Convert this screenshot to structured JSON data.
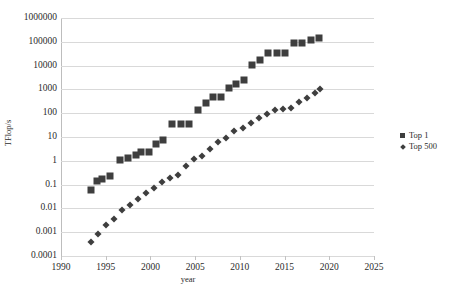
{
  "chart_data": {
    "type": "scatter",
    "title": "",
    "xlabel": "year",
    "ylabel": "TFlop/s",
    "xlim": [
      1990,
      2025
    ],
    "ylim": [
      0.0001,
      1000000
    ],
    "yscale": "log",
    "grid": true,
    "legend_position": "right",
    "xticks": [
      "1990",
      "1995",
      "2000",
      "2005",
      "2010",
      "2015",
      "2020",
      "2025"
    ],
    "xtick_values": [
      1990,
      1995,
      2000,
      2005,
      2010,
      2015,
      2020,
      2025
    ],
    "yticks": [
      "1000000",
      "100000",
      "10000",
      "1000",
      "100",
      "10",
      "1",
      "0.1",
      "0.01",
      "0.001",
      "0.0001"
    ],
    "ytick_values": [
      1000000,
      100000,
      10000,
      1000,
      100,
      10,
      1,
      0.1,
      0.01,
      0.001,
      0.0001
    ],
    "series": [
      {
        "name": "Top 1",
        "marker": "square",
        "color": "#3e3e3e",
        "points": [
          [
            1993.4,
            0.06
          ],
          [
            1994.0,
            0.143
          ],
          [
            1994.6,
            0.17
          ],
          [
            1995.5,
            0.22
          ],
          [
            1996.6,
            1.07
          ],
          [
            1997.5,
            1.34
          ],
          [
            1998.4,
            1.83
          ],
          [
            1999.0,
            2.38
          ],
          [
            1999.8,
            2.38
          ],
          [
            2000.6,
            4.94
          ],
          [
            2001.4,
            7.23
          ],
          [
            2002.4,
            35.9
          ],
          [
            2003.4,
            35.9
          ],
          [
            2004.3,
            35.9
          ],
          [
            2005.3,
            136.8
          ],
          [
            2006.2,
            280.6
          ],
          [
            2007.0,
            478.2
          ],
          [
            2007.9,
            478.2
          ],
          [
            2008.8,
            1105.0
          ],
          [
            2009.6,
            1759.0
          ],
          [
            2010.5,
            2566.0
          ],
          [
            2011.4,
            10510.0
          ],
          [
            2012.3,
            17590.0
          ],
          [
            2013.2,
            33863.0
          ],
          [
            2014.2,
            33863.0
          ],
          [
            2015.1,
            33863.0
          ],
          [
            2016.1,
            93015.0
          ],
          [
            2017.0,
            93015.0
          ],
          [
            2018.0,
            122300.0
          ],
          [
            2018.9,
            148600.0
          ]
        ]
      },
      {
        "name": "Top 500",
        "marker": "diamond",
        "color": "#3e3e3e",
        "points": [
          [
            1993.4,
            0.0004
          ],
          [
            1994.1,
            0.00082
          ],
          [
            1995.0,
            0.002
          ],
          [
            1995.9,
            0.0035
          ],
          [
            1996.8,
            0.0083
          ],
          [
            1997.7,
            0.0134
          ],
          [
            1998.6,
            0.0251
          ],
          [
            1999.5,
            0.0452
          ],
          [
            2000.4,
            0.0692
          ],
          [
            2001.3,
            0.134
          ],
          [
            2002.2,
            0.195
          ],
          [
            2003.1,
            0.245
          ],
          [
            2004.0,
            0.624
          ],
          [
            2004.9,
            1.166
          ],
          [
            2005.8,
            1.65
          ],
          [
            2006.7,
            3.2
          ],
          [
            2007.6,
            5.9
          ],
          [
            2008.5,
            9.0
          ],
          [
            2009.4,
            17.1
          ],
          [
            2010.3,
            24.7
          ],
          [
            2011.2,
            40.2
          ],
          [
            2012.1,
            60.8
          ],
          [
            2013.0,
            96.6
          ],
          [
            2013.9,
            133.7
          ],
          [
            2014.8,
            153.4
          ],
          [
            2015.7,
            166.0
          ],
          [
            2016.6,
            286.1
          ],
          [
            2017.5,
            432.0
          ],
          [
            2018.4,
            716.0
          ],
          [
            2019.0,
            1022.0
          ]
        ]
      }
    ]
  },
  "legend": {
    "items": [
      {
        "label": "Top 1",
        "marker": "square"
      },
      {
        "label": "Top 500",
        "marker": "diamond"
      }
    ]
  }
}
